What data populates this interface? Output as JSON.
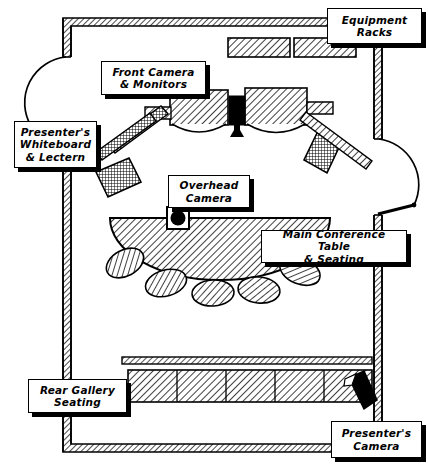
{
  "diagram": {
    "type": "architectural-floor-plan",
    "background_color": "#ffffff",
    "line_color": "#000000",
    "hatch_color": "#000000",
    "width": 428,
    "height": 466
  },
  "callouts": [
    {
      "id": "equipment-racks",
      "label": "Equipment\nRacks",
      "x": 327,
      "y": 8,
      "width": 95,
      "height": 36
    },
    {
      "id": "front-camera-monitors",
      "label": "Front Camera\n& Monitors",
      "x": 101,
      "y": 61,
      "width": 105,
      "height": 34
    },
    {
      "id": "presenters-whiteboard-lectern",
      "label": "Presenter's\nWhiteboard\n& Lectern",
      "x": 14,
      "y": 121,
      "width": 83,
      "height": 47
    },
    {
      "id": "overhead-camera",
      "label": "Overhead\nCamera",
      "x": 168,
      "y": 175,
      "width": 82,
      "height": 33
    },
    {
      "id": "main-conference-table-seating",
      "label": "Main Conference Table\n& Seating",
      "x": 261,
      "y": 230,
      "width": 146,
      "height": 33
    },
    {
      "id": "rear-gallery-seating",
      "label": "Rear Gallery\nSeating",
      "x": 28,
      "y": 379,
      "width": 99,
      "height": 34
    },
    {
      "id": "presenters-camera",
      "label": "Presenter's\nCamera",
      "x": 331,
      "y": 421,
      "width": 91,
      "height": 37
    }
  ],
  "room_features": [
    {
      "id": "outer-wall",
      "name": "room-perimeter-wall"
    },
    {
      "id": "left-door",
      "name": "left-door-swing"
    },
    {
      "id": "right-door",
      "name": "right-door-swing"
    },
    {
      "id": "equipment-rack-1",
      "name": "equipment-rack"
    },
    {
      "id": "equipment-rack-2",
      "name": "equipment-rack"
    },
    {
      "id": "monitor-left",
      "name": "front-monitor"
    },
    {
      "id": "monitor-right",
      "name": "front-monitor"
    },
    {
      "id": "front-camera",
      "name": "front-camera"
    },
    {
      "id": "whiteboard",
      "name": "presenter-whiteboard"
    },
    {
      "id": "lectern",
      "name": "presenter-lectern"
    },
    {
      "id": "side-cabinet-left",
      "name": "side-cabinet"
    },
    {
      "id": "side-cabinet-right",
      "name": "side-cabinet"
    },
    {
      "id": "conference-table",
      "name": "main-conference-table"
    },
    {
      "id": "overhead-camera",
      "name": "overhead-camera-marker"
    },
    {
      "id": "chairs",
      "name": "conference-chairs",
      "count": 6
    },
    {
      "id": "gallery-rail",
      "name": "rear-gallery-rail"
    },
    {
      "id": "gallery-bench",
      "name": "rear-gallery-bench",
      "sections": 5
    },
    {
      "id": "presenter-camera",
      "name": "presenter-camera"
    }
  ]
}
